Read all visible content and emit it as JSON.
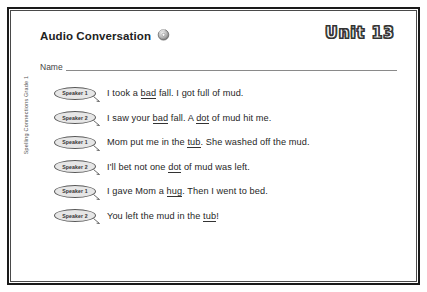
{
  "document": {
    "title": "Audio Conversation",
    "audio_icon": "audio-disc-icon",
    "unit_badge": "Unit 13",
    "name_label": "Name",
    "side_credit": "Spelling Connections Grade 1"
  },
  "dialogue": [
    {
      "speaker": "Speaker 1",
      "text_before": "I took a ",
      "underlined": "bad",
      "text_after": " fall. I got full of mud.",
      "full_text": "I took a bad fall. I got full of mud."
    },
    {
      "speaker": "Speaker 2",
      "text_before": "I saw your ",
      "underlined": "bad",
      "text_mid": " fall. A ",
      "underlined2": "dot",
      "text_after": " of mud hit me.",
      "full_text": "I saw your bad fall. A dot of mud hit me."
    },
    {
      "speaker": "Speaker 1",
      "text_before": "Mom put me in the ",
      "underlined": "tub",
      "text_after": ". She washed off the mud.",
      "full_text": "Mom put me in the tub. She washed off the mud."
    },
    {
      "speaker": "Speaker 2",
      "text_before": "I'll bet not one ",
      "underlined": "dot",
      "text_after": " of mud was left.",
      "full_text": "I'll bet not one dot of mud was left."
    },
    {
      "speaker": "Speaker 1",
      "text_before": "I gave Mom a ",
      "underlined": "hug",
      "text_after": ". Then I went to bed.",
      "full_text": "I gave Mom a hug. Then I went to bed."
    },
    {
      "speaker": "Speaker 2",
      "text_before": "You left the mud in the ",
      "underlined": "tub",
      "text_after": "!",
      "full_text": "You left the mud in the tub!"
    }
  ],
  "colors": {
    "frame": "#1a1a1a",
    "text": "#262626",
    "bubble_fill": "#e6e6e6",
    "rule": "#8a8a8a"
  }
}
